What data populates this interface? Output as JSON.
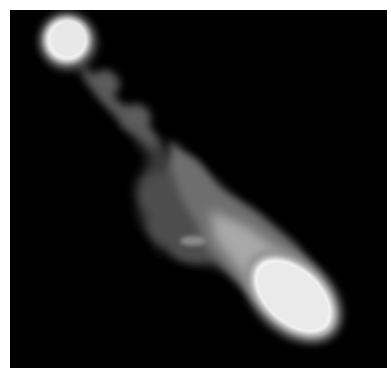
{
  "image": {
    "description": "Grayscale intensity map of an elongated diagonal blob on black background",
    "background_color": "#000000",
    "page_color": "#ffffff",
    "colors": {
      "dim": "#4a4a4a",
      "mid": "#7a7a7a",
      "bright": "#bdbdbd",
      "peak": "#f4f4f4"
    },
    "blobs": [
      {
        "name": "top-left-head",
        "cx": 57,
        "cy": 30,
        "r": 22
      },
      {
        "name": "bottom-right-head",
        "cx": 283,
        "cy": 286,
        "rx": 48,
        "ry": 30,
        "rotation": 42
      }
    ]
  }
}
